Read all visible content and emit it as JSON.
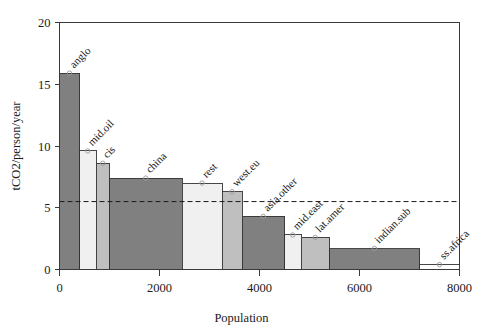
{
  "chart_data": {
    "type": "bar",
    "title": "",
    "subtitle": "",
    "xlabel": "Population",
    "ylabel": "tCO2/person/year",
    "xlim": [
      0,
      8000
    ],
    "ylim": [
      0,
      20
    ],
    "xticks": [
      0,
      2000,
      4000,
      6000,
      8000
    ],
    "xticklabels": [
      "0",
      "2000",
      "4000",
      "6000",
      "8000"
    ],
    "yticks": [
      0,
      5,
      10,
      15,
      20
    ],
    "yticklabels": [
      "0",
      "5",
      "10",
      "15",
      "20"
    ],
    "grid": false,
    "legend": "none",
    "variable_width_bars": true,
    "note": "Variable-width bar chart: bar width = population share, bar height = tCO2 per person per year; cumulative population on x-axis",
    "annotations": [
      {
        "name": "world-average-reference-line",
        "kind": "horizontal-dashed-line",
        "y": 5.5,
        "style": "dashed",
        "color": "#1a1a1a",
        "label": ""
      }
    ],
    "categories": [
      "anglo",
      "mid.oil",
      "cis",
      "china",
      "rest",
      "west.eu",
      "asia.other",
      "mid.east",
      "lat.amer",
      "indian.sub",
      "ss.africa"
    ],
    "values": [
      15.9,
      9.6,
      8.6,
      7.4,
      7.0,
      6.3,
      4.3,
      2.8,
      2.6,
      1.7,
      0.4
    ],
    "widths": [
      400,
      330,
      270,
      1450,
      800,
      400,
      850,
      330,
      570,
      1800,
      800
    ],
    "x_start": [
      0,
      400,
      730,
      1000,
      2450,
      3250,
      3650,
      4500,
      4830,
      5400,
      7200
    ],
    "x_end": [
      400,
      730,
      1000,
      2450,
      3250,
      3650,
      4500,
      4830,
      5400,
      7200,
      8000
    ],
    "bar_fills": [
      "#808080",
      "#f0f0f0",
      "#bfbfbf",
      "#808080",
      "#f0f0f0",
      "#bfbfbf",
      "#808080",
      "#f0f0f0",
      "#bfbfbf",
      "#808080",
      "#ffffff"
    ],
    "bars": [
      {
        "label": "anglo",
        "value": 15.9,
        "x_start": 0,
        "x_end": 400,
        "width": 400,
        "fill": "#808080"
      },
      {
        "label": "mid.oil",
        "value": 9.6,
        "x_start": 400,
        "x_end": 730,
        "width": 330,
        "fill": "#f0f0f0"
      },
      {
        "label": "cis",
        "value": 8.6,
        "x_start": 730,
        "x_end": 1000,
        "width": 270,
        "fill": "#bfbfbf"
      },
      {
        "label": "china",
        "value": 7.4,
        "x_start": 1000,
        "x_end": 2450,
        "width": 1450,
        "fill": "#808080"
      },
      {
        "label": "rest",
        "value": 7.0,
        "x_start": 2450,
        "x_end": 3250,
        "width": 800,
        "fill": "#f0f0f0"
      },
      {
        "label": "west.eu",
        "value": 6.3,
        "x_start": 3250,
        "x_end": 3650,
        "width": 400,
        "fill": "#bfbfbf"
      },
      {
        "label": "asia.other",
        "value": 4.3,
        "x_start": 3650,
        "x_end": 4500,
        "width": 850,
        "fill": "#808080"
      },
      {
        "label": "mid.east",
        "value": 2.8,
        "x_start": 4500,
        "x_end": 4830,
        "width": 330,
        "fill": "#f0f0f0"
      },
      {
        "label": "lat.amer",
        "value": 2.6,
        "x_start": 4830,
        "x_end": 5400,
        "width": 570,
        "fill": "#bfbfbf"
      },
      {
        "label": "indian.sub",
        "value": 1.7,
        "x_start": 5400,
        "x_end": 7200,
        "width": 1800,
        "fill": "#808080"
      },
      {
        "label": "ss.africa",
        "value": 0.4,
        "x_start": 7200,
        "x_end": 8000,
        "width": 800,
        "fill": "#ffffff"
      }
    ]
  },
  "colors": {
    "axis": "#3a3a3a",
    "text": "#1a1a1a",
    "background": "#ffffff",
    "bar_dark": "#808080",
    "bar_light": "#f0f0f0",
    "bar_medium": "#bfbfbf",
    "bar_white": "#ffffff",
    "reference_line": "#1a1a1a"
  }
}
